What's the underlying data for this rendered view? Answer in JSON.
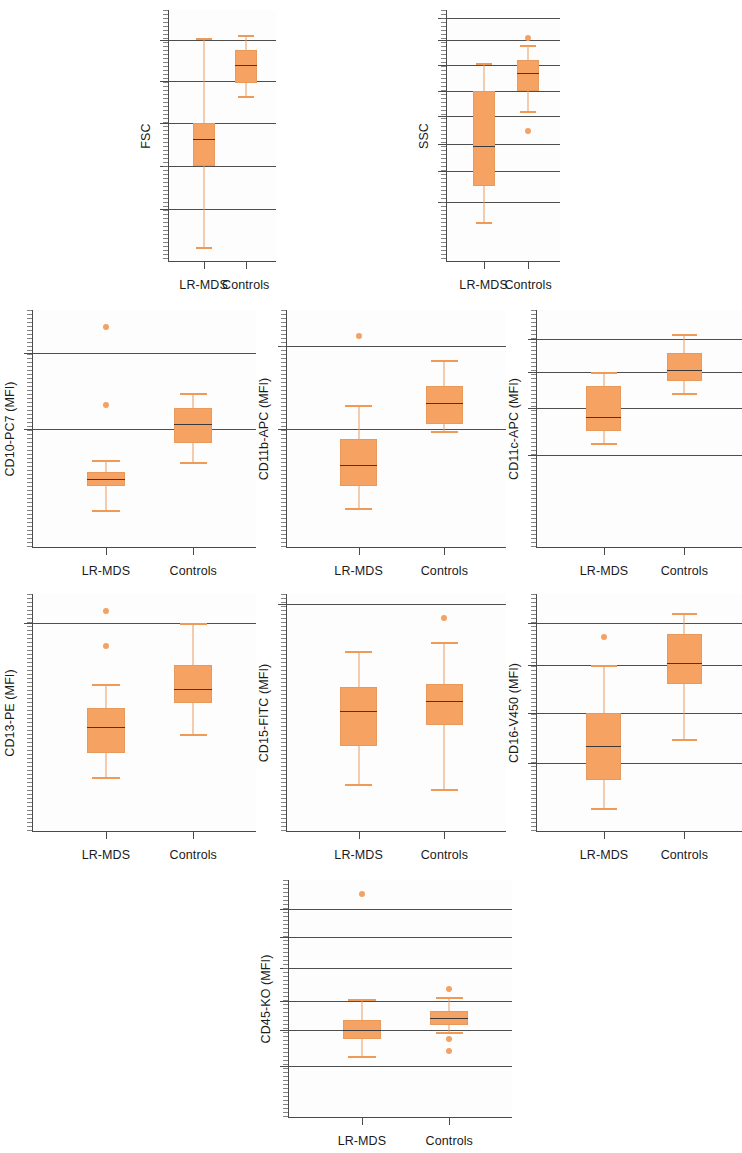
{
  "figure": {
    "group_labels": [
      "LR-MDS",
      "Controls"
    ],
    "box_color": "#F5A263",
    "median_color": "#3a3a3a",
    "grid_color": "#4e4e4e",
    "axis_color": "#4a4a4a"
  },
  "chart_data": [
    {
      "id": "fsc",
      "type": "box",
      "ylabel": "FSC",
      "xlabel": "",
      "categories": [
        "LR-MDS",
        "Controls"
      ],
      "ylim": [
        0,
        100
      ],
      "grid": true,
      "gridlines": [
        88,
        72,
        55,
        38,
        21
      ],
      "series": [
        {
          "name": "LR-MDS",
          "min": 6,
          "q1": 38,
          "median": 49,
          "q3": 55,
          "max": 89,
          "outliers": []
        },
        {
          "name": "Controls",
          "min": 66,
          "q1": 71,
          "median": 78,
          "q3": 84,
          "max": 90,
          "outliers": []
        }
      ]
    },
    {
      "id": "ssc",
      "type": "box",
      "ylabel": "SSC",
      "xlabel": "",
      "categories": [
        "LR-MDS",
        "Controls"
      ],
      "ylim": [
        0,
        100
      ],
      "grid": true,
      "gridlines": [
        97,
        88,
        78,
        68,
        58,
        47,
        36,
        24
      ],
      "series": [
        {
          "name": "LR-MDS",
          "min": 16,
          "q1": 30,
          "median": 46,
          "q3": 68,
          "max": 79,
          "outliers": []
        },
        {
          "name": "Controls",
          "min": 60,
          "q1": 68,
          "median": 75,
          "q3": 80,
          "max": 86,
          "outliers": [
            89,
            52
          ]
        }
      ]
    },
    {
      "id": "cd10-pc7",
      "type": "box",
      "ylabel": "CD10-PC7 (MFI)",
      "xlabel": "",
      "categories": [
        "LR-MDS",
        "Controls"
      ],
      "ylim": [
        0,
        100
      ],
      "grid": true,
      "gridlines": [
        82,
        50
      ],
      "series": [
        {
          "name": "LR-MDS",
          "min": 16,
          "q1": 26,
          "median": 29,
          "q3": 32,
          "max": 37,
          "outliers": [
            93,
            60
          ]
        },
        {
          "name": "Controls",
          "min": 36,
          "q1": 44,
          "median": 52,
          "q3": 59,
          "max": 65,
          "outliers": []
        }
      ]
    },
    {
      "id": "cd11b-apc",
      "type": "box",
      "ylabel": "CD11b-APC (MFI)",
      "xlabel": "",
      "categories": [
        "LR-MDS",
        "Controls"
      ],
      "ylim": [
        0,
        100
      ],
      "grid": true,
      "gridlines": [
        85,
        50
      ],
      "series": [
        {
          "name": "LR-MDS",
          "min": 17,
          "q1": 26,
          "median": 35,
          "q3": 46,
          "max": 60,
          "outliers": [
            89
          ]
        },
        {
          "name": "Controls",
          "min": 49,
          "q1": 52,
          "median": 61,
          "q3": 68,
          "max": 79,
          "outliers": []
        }
      ]
    },
    {
      "id": "cd11c-apc",
      "type": "box",
      "ylabel": "CD11c-APC (MFI)",
      "xlabel": "",
      "categories": [
        "LR-MDS",
        "Controls"
      ],
      "ylim": [
        0,
        100
      ],
      "grid": true,
      "gridlines": [
        88,
        74,
        59,
        39
      ],
      "series": [
        {
          "name": "LR-MDS",
          "min": 44,
          "q1": 49,
          "median": 55,
          "q3": 68,
          "max": 74,
          "outliers": []
        },
        {
          "name": "Controls",
          "min": 65,
          "q1": 70,
          "median": 75,
          "q3": 82,
          "max": 90,
          "outliers": []
        }
      ]
    },
    {
      "id": "cd13-pe",
      "type": "box",
      "ylabel": "CD13-PE (MFI)",
      "xlabel": "",
      "categories": [
        "LR-MDS",
        "Controls"
      ],
      "ylim": [
        0,
        100
      ],
      "grid": true,
      "gridlines": [
        88
      ],
      "series": [
        {
          "name": "LR-MDS",
          "min": 23,
          "q1": 33,
          "median": 44,
          "q3": 52,
          "max": 62,
          "outliers": [
            93,
            78
          ]
        },
        {
          "name": "Controls",
          "min": 41,
          "q1": 54,
          "median": 60,
          "q3": 70,
          "max": 88,
          "outliers": []
        }
      ]
    },
    {
      "id": "cd15-fitc",
      "type": "box",
      "ylabel": "CD15-FITC (MFI)",
      "xlabel": "",
      "categories": [
        "LR-MDS",
        "Controls"
      ],
      "ylim": [
        0,
        100
      ],
      "grid": true,
      "gridlines": [
        96
      ],
      "series": [
        {
          "name": "LR-MDS",
          "min": 20,
          "q1": 36,
          "median": 51,
          "q3": 61,
          "max": 76,
          "outliers": []
        },
        {
          "name": "Controls",
          "min": 18,
          "q1": 45,
          "median": 55,
          "q3": 62,
          "max": 80,
          "outliers": [
            90
          ]
        }
      ]
    },
    {
      "id": "cd16-v450",
      "type": "box",
      "ylabel": "CD16-V450 (MFI)",
      "xlabel": "",
      "categories": [
        "LR-MDS",
        "Controls"
      ],
      "ylim": [
        0,
        100
      ],
      "grid": true,
      "gridlines": [
        88,
        70,
        50,
        29
      ],
      "series": [
        {
          "name": "LR-MDS",
          "min": 10,
          "q1": 22,
          "median": 36,
          "q3": 50,
          "max": 70,
          "outliers": [
            82
          ]
        },
        {
          "name": "Controls",
          "min": 39,
          "q1": 62,
          "median": 71,
          "q3": 83,
          "max": 92,
          "outliers": []
        }
      ]
    },
    {
      "id": "cd45-ko",
      "type": "box",
      "ylabel": "CD45-KO (MFI)",
      "xlabel": "",
      "categories": [
        "LR-MDS",
        "Controls"
      ],
      "ylim": [
        0,
        100
      ],
      "grid": true,
      "gridlines": [
        88,
        76,
        63,
        49,
        37,
        22
      ],
      "series": [
        {
          "name": "LR-MDS",
          "min": 26,
          "q1": 33,
          "median": 37,
          "q3": 41,
          "max": 50,
          "outliers": [
            94
          ]
        },
        {
          "name": "Controls",
          "min": 36,
          "q1": 39,
          "median": 42,
          "q3": 45,
          "max": 51,
          "outliers": [
            54,
            33,
            28
          ]
        }
      ]
    }
  ]
}
